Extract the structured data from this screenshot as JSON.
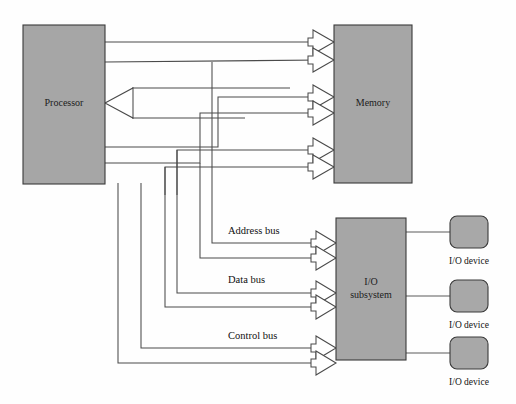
{
  "diagram": {
    "colors": {
      "block_fill": "#a6a6a6",
      "block_stroke": "#3a3a3a",
      "wire": "#4a4a4a",
      "arrow_fill": "#ffffff",
      "background": "#ffffff",
      "text": "#101010"
    },
    "blocks": {
      "processor": {
        "label": "Processor",
        "x": 23,
        "y": 25,
        "width": 82,
        "height": 159
      },
      "memory": {
        "label": "Memory",
        "x": 334,
        "y": 25,
        "width": 78,
        "height": 158
      },
      "io_subsystem": {
        "label_line1": "I/O",
        "label_line2": "subsystem",
        "x": 336,
        "y": 218,
        "width": 70,
        "height": 142
      }
    },
    "devices": [
      {
        "label": "I/O device",
        "x": 450,
        "y": 216,
        "width": 38,
        "height": 32
      },
      {
        "label": "I/O device",
        "x": 450,
        "y": 280,
        "width": 38,
        "height": 32
      },
      {
        "label": "I/O device",
        "x": 450,
        "y": 337,
        "width": 38,
        "height": 32
      }
    ],
    "bus_labels": [
      {
        "name": "address-bus",
        "text": "Address bus",
        "x": 228,
        "y": 232
      },
      {
        "name": "data-bus",
        "text": "Data bus",
        "x": 228,
        "y": 281
      },
      {
        "name": "control-bus",
        "text": "Control bus",
        "x": 228,
        "y": 337
      }
    ],
    "buses": [
      {
        "name": "address-bus",
        "direction_to_memory": "out",
        "direction_to_io": "out"
      },
      {
        "name": "data-bus",
        "direction_to_memory": "bidirectional",
        "direction_to_io": "bidirectional"
      },
      {
        "name": "control-bus",
        "direction_to_memory": "out",
        "direction_to_io": "out"
      }
    ]
  }
}
